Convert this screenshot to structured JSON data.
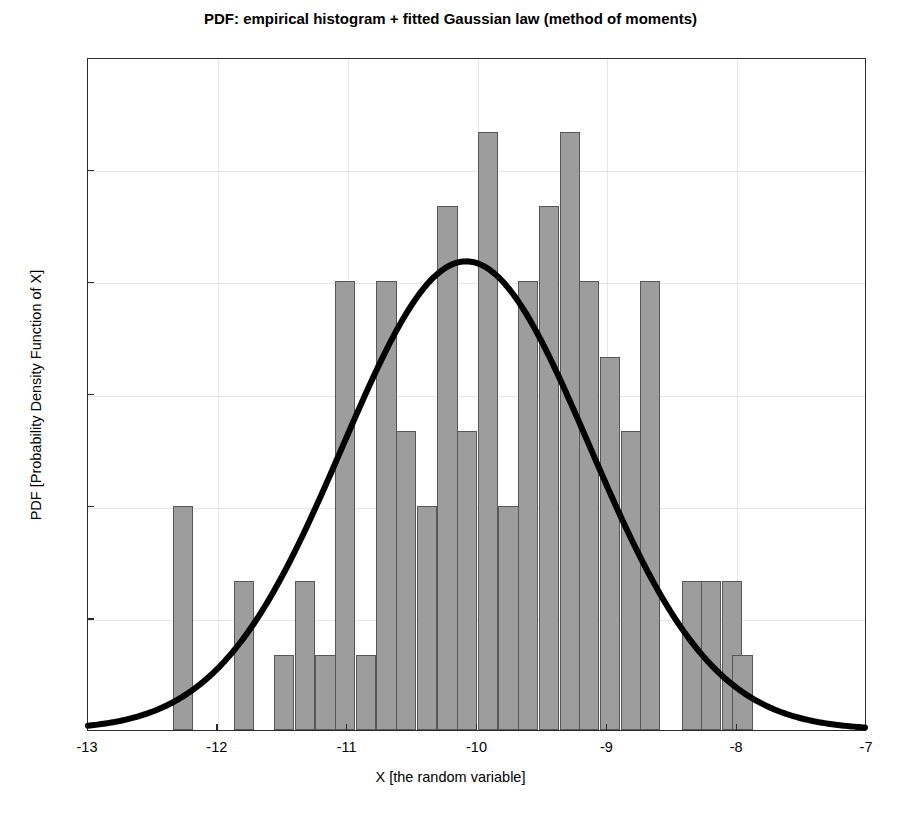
{
  "chart_data": {
    "type": "bar",
    "title": "PDF: empirical histogram + fitted Gaussian law (method of moments)",
    "xlabel": "X [the random variable]",
    "ylabel": "PDF [Probability Density Function of X]",
    "xlim": [
      -13,
      -7
    ],
    "ylim": [
      0,
      0.6
    ],
    "xticks": [
      -13,
      -12,
      -11,
      -10,
      -9,
      -8,
      -7
    ],
    "xtick_labels": [
      "-13",
      "-12",
      "-11",
      "-10",
      "-9",
      "-8",
      "-7"
    ],
    "yticks": [
      0,
      0.1,
      0.2,
      0.3,
      0.4,
      0.5,
      0.6
    ],
    "ytick_labels": [
      "0",
      "0.1",
      "0.2",
      "0.3",
      "0.4",
      "0.5",
      "0.6"
    ],
    "grid": true,
    "legend": null,
    "bar_color": "#9d9d9d",
    "bar_edge_color": "#575757",
    "curve_color": "#000000",
    "bin_width": 0.1567,
    "bars": [
      {
        "center": -12.27,
        "value": 0.2
      },
      {
        "center": -11.8,
        "value": 0.133
      },
      {
        "center": -11.49,
        "value": 0.067
      },
      {
        "center": -11.33,
        "value": 0.133
      },
      {
        "center": -11.17,
        "value": 0.067
      },
      {
        "center": -11.02,
        "value": 0.4
      },
      {
        "center": -10.86,
        "value": 0.067
      },
      {
        "center": -10.7,
        "value": 0.4
      },
      {
        "center": -10.55,
        "value": 0.267
      },
      {
        "center": -10.39,
        "value": 0.2
      },
      {
        "center": -10.23,
        "value": 0.467
      },
      {
        "center": -10.08,
        "value": 0.267
      },
      {
        "center": -9.92,
        "value": 0.533
      },
      {
        "center": -9.76,
        "value": 0.2
      },
      {
        "center": -9.61,
        "value": 0.4
      },
      {
        "center": -9.45,
        "value": 0.467
      },
      {
        "center": -9.29,
        "value": 0.533
      },
      {
        "center": -9.14,
        "value": 0.4
      },
      {
        "center": -8.98,
        "value": 0.333
      },
      {
        "center": -8.82,
        "value": 0.267
      },
      {
        "center": -8.67,
        "value": 0.4
      },
      {
        "center": -8.35,
        "value": 0.133
      },
      {
        "center": -8.2,
        "value": 0.133
      },
      {
        "center": -8.04,
        "value": 0.133
      },
      {
        "center": -7.96,
        "value": 0.067
      }
    ],
    "fitted_curve": {
      "name": "fitted Gaussian law (method of moments)",
      "distribution": "normal",
      "mean": -10.08,
      "std": 0.952,
      "peak_value": 0.419,
      "line_width_px": 6
    }
  }
}
